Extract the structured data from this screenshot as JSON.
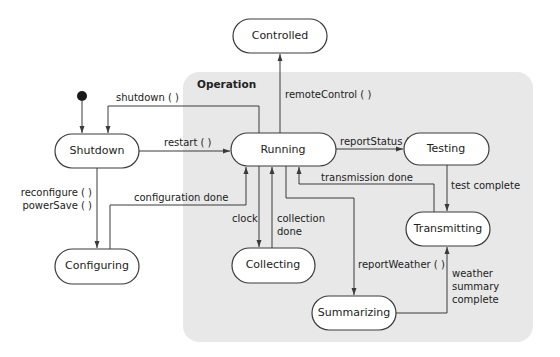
{
  "diagram": {
    "type": "uml-state-machine",
    "group": {
      "label": "Operation",
      "color": "#e8e8e8"
    },
    "states": [
      {
        "id": "controlled",
        "label": "Controlled"
      },
      {
        "id": "shutdown",
        "label": "Shutdown"
      },
      {
        "id": "running",
        "label": "Running"
      },
      {
        "id": "testing",
        "label": "Testing"
      },
      {
        "id": "transmitting",
        "label": "Transmitting"
      },
      {
        "id": "collecting",
        "label": "Collecting"
      },
      {
        "id": "configuring",
        "label": "Configuring"
      },
      {
        "id": "summarizing",
        "label": "Summarizing"
      }
    ],
    "transitions": [
      {
        "from": "initial",
        "to": "shutdown",
        "label": ""
      },
      {
        "from": "running",
        "to": "shutdown",
        "label": "shutdown ( )"
      },
      {
        "from": "shutdown",
        "to": "running",
        "label": "restart ( )"
      },
      {
        "from": "running",
        "to": "controlled",
        "label": "remoteControl ( )"
      },
      {
        "from": "running",
        "to": "testing",
        "label": "reportStatus ( )"
      },
      {
        "from": "transmitting",
        "to": "running",
        "label": "transmission done"
      },
      {
        "from": "testing",
        "to": "transmitting",
        "label": "test complete"
      },
      {
        "from": "shutdown",
        "to": "configuring",
        "label_lines": [
          "reconfigure ( )",
          "powerSave ( )"
        ]
      },
      {
        "from": "configuring",
        "to": "running",
        "label": "configuration done"
      },
      {
        "from": "running",
        "to": "collecting",
        "label": "clock"
      },
      {
        "from": "collecting",
        "to": "running",
        "label_lines": [
          "collection",
          "done"
        ]
      },
      {
        "from": "running",
        "to": "summarizing",
        "label": "reportWeather ( )"
      },
      {
        "from": "summarizing",
        "to": "transmitting",
        "label_lines": [
          "weather",
          "summary",
          "complete"
        ]
      }
    ]
  }
}
